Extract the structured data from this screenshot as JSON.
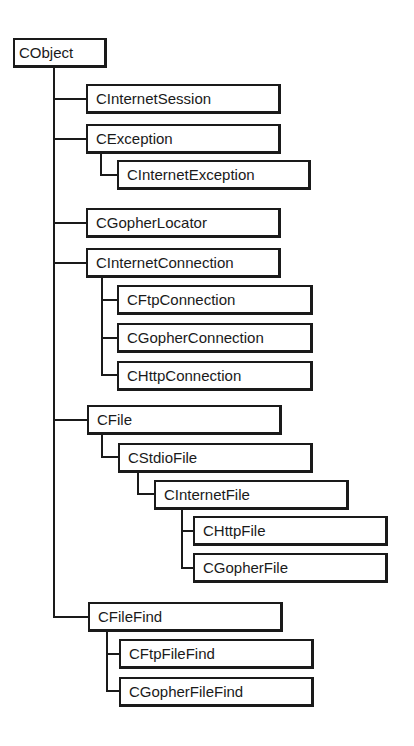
{
  "diagram": {
    "root": "CObject",
    "nodes": [
      {
        "id": "cobject",
        "label": "CObject",
        "parent": null
      },
      {
        "id": "cinternetsession",
        "label": "CInternetSession",
        "parent": "CObject"
      },
      {
        "id": "cexception",
        "label": "CException",
        "parent": "CObject"
      },
      {
        "id": "cinternetexception",
        "label": "CInternetException",
        "parent": "CException"
      },
      {
        "id": "cgopherlocator",
        "label": "CGopherLocator",
        "parent": "CObject"
      },
      {
        "id": "cinternetconnection",
        "label": "CInternetConnection",
        "parent": "CObject"
      },
      {
        "id": "cftpconnection",
        "label": "CFtpConnection",
        "parent": "CInternetConnection"
      },
      {
        "id": "cgopherconnection",
        "label": "CGopherConnection",
        "parent": "CInternetConnection"
      },
      {
        "id": "chttpconnection",
        "label": "CHttpConnection",
        "parent": "CInternetConnection"
      },
      {
        "id": "cfile",
        "label": "CFile",
        "parent": "CObject"
      },
      {
        "id": "cstdiofile",
        "label": "CStdioFile",
        "parent": "CFile"
      },
      {
        "id": "cinternetfile",
        "label": "CInternetFile",
        "parent": "CStdioFile"
      },
      {
        "id": "chttpfile",
        "label": "CHttpFile",
        "parent": "CInternetFile"
      },
      {
        "id": "cgopherfile",
        "label": "CGopherFile",
        "parent": "CInternetFile"
      },
      {
        "id": "cfilefind",
        "label": "CFileFind",
        "parent": "CObject"
      },
      {
        "id": "cftpfilefind",
        "label": "CFtpFileFind",
        "parent": "CFileFind"
      },
      {
        "id": "cgopherfilefind",
        "label": "CGopherFileFind",
        "parent": "CFileFind"
      }
    ]
  },
  "colors": {
    "line": "#1a1a1a",
    "box_fill": "#ffffff",
    "background": "#ffffff"
  }
}
